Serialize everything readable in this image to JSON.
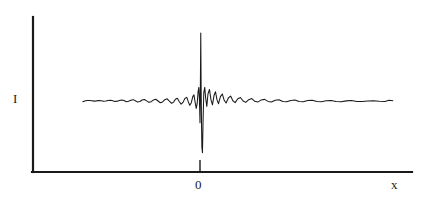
{
  "figure": {
    "background_color": "#ffffff",
    "line_color": "#1a1a1a",
    "axis_color": "#1a1a1a"
  },
  "axes": {
    "y_axis_label": "I",
    "x_axis_label": "x",
    "y_axis_name": "y-axis-line",
    "x_axis_name": "x-axis-line",
    "origin_px": {
      "x": 33,
      "y": 172
    },
    "y_axis_top_px": 17,
    "x_axis_right_px": 412,
    "ticks": [
      {
        "label": "0",
        "x_px": 200
      }
    ]
  },
  "chart_data": {
    "type": "line",
    "title": "",
    "subtitle": "",
    "xlabel": "x",
    "ylabel": "I",
    "grid": false,
    "legend": null,
    "xlim": [
      -1.0,
      1.0
    ],
    "ylim": [
      0,
      1
    ],
    "xticks": [
      0
    ],
    "xticklabels": [
      "0"
    ],
    "yticks": [],
    "yticklabels": [],
    "baseline_level": 0.46,
    "series": [
      {
        "name": "interferogram",
        "color": "#1a1a1a",
        "x_start": -0.62,
        "x_end": 1.02,
        "points": [
          [
            -0.62,
            0.455
          ],
          [
            -0.61,
            0.46
          ],
          [
            -0.598,
            0.463
          ],
          [
            -0.585,
            0.464
          ],
          [
            -0.572,
            0.462
          ],
          [
            -0.56,
            0.459
          ],
          [
            -0.548,
            0.461
          ],
          [
            -0.535,
            0.464
          ],
          [
            -0.522,
            0.462
          ],
          [
            -0.51,
            0.458
          ],
          [
            -0.498,
            0.46
          ],
          [
            -0.486,
            0.464
          ],
          [
            -0.474,
            0.466
          ],
          [
            -0.462,
            0.462
          ],
          [
            -0.45,
            0.457
          ],
          [
            -0.438,
            0.459
          ],
          [
            -0.426,
            0.464
          ],
          [
            -0.414,
            0.468
          ],
          [
            -0.402,
            0.463
          ],
          [
            -0.39,
            0.455
          ],
          [
            -0.378,
            0.458
          ],
          [
            -0.366,
            0.466
          ],
          [
            -0.354,
            0.47
          ],
          [
            -0.342,
            0.462
          ],
          [
            -0.33,
            0.452
          ],
          [
            -0.318,
            0.456
          ],
          [
            -0.306,
            0.467
          ],
          [
            -0.294,
            0.471
          ],
          [
            -0.282,
            0.461
          ],
          [
            -0.27,
            0.45
          ],
          [
            -0.258,
            0.455
          ],
          [
            -0.246,
            0.468
          ],
          [
            -0.234,
            0.473
          ],
          [
            -0.222,
            0.46
          ],
          [
            -0.21,
            0.447
          ],
          [
            -0.198,
            0.453
          ],
          [
            -0.186,
            0.47
          ],
          [
            -0.174,
            0.476
          ],
          [
            -0.162,
            0.459
          ],
          [
            -0.15,
            0.443
          ],
          [
            -0.14,
            0.452
          ],
          [
            -0.13,
            0.473
          ],
          [
            -0.12,
            0.48
          ],
          [
            -0.11,
            0.456
          ],
          [
            -0.1,
            0.437
          ],
          [
            -0.09,
            0.45
          ],
          [
            -0.08,
            0.478
          ],
          [
            -0.07,
            0.487
          ],
          [
            -0.062,
            0.455
          ],
          [
            -0.054,
            0.428
          ],
          [
            -0.046,
            0.448
          ],
          [
            -0.038,
            0.492
          ],
          [
            -0.032,
            0.505
          ],
          [
            -0.026,
            0.452
          ],
          [
            -0.02,
            0.405
          ],
          [
            -0.015,
            0.44
          ],
          [
            -0.01,
            0.53
          ],
          [
            -0.006,
            0.56
          ],
          [
            -0.003,
            0.47
          ],
          [
            0.0,
            0.3
          ],
          [
            0.002,
            0.56
          ],
          [
            0.004,
            0.96
          ],
          [
            0.006,
            0.56
          ],
          [
            0.008,
            0.3
          ],
          [
            0.01,
            0.12
          ],
          [
            0.013,
            0.08
          ],
          [
            0.016,
            0.3
          ],
          [
            0.02,
            0.52
          ],
          [
            0.025,
            0.56
          ],
          [
            0.03,
            0.48
          ],
          [
            0.036,
            0.42
          ],
          [
            0.042,
            0.51
          ],
          [
            0.05,
            0.545
          ],
          [
            0.058,
            0.47
          ],
          [
            0.066,
            0.432
          ],
          [
            0.074,
            0.5
          ],
          [
            0.082,
            0.528
          ],
          [
            0.09,
            0.468
          ],
          [
            0.098,
            0.44
          ],
          [
            0.108,
            0.492
          ],
          [
            0.118,
            0.512
          ],
          [
            0.128,
            0.465
          ],
          [
            0.138,
            0.445
          ],
          [
            0.15,
            0.482
          ],
          [
            0.162,
            0.496
          ],
          [
            0.174,
            0.462
          ],
          [
            0.186,
            0.448
          ],
          [
            0.2,
            0.476
          ],
          [
            0.214,
            0.486
          ],
          [
            0.228,
            0.46
          ],
          [
            0.242,
            0.45
          ],
          [
            0.258,
            0.47
          ],
          [
            0.274,
            0.478
          ],
          [
            0.29,
            0.458
          ],
          [
            0.306,
            0.452
          ],
          [
            0.324,
            0.468
          ],
          [
            0.342,
            0.472
          ],
          [
            0.36,
            0.457
          ],
          [
            0.378,
            0.453
          ],
          [
            0.398,
            0.465
          ],
          [
            0.418,
            0.469
          ],
          [
            0.438,
            0.456
          ],
          [
            0.458,
            0.454
          ],
          [
            0.48,
            0.464
          ],
          [
            0.502,
            0.467
          ],
          [
            0.524,
            0.456
          ],
          [
            0.546,
            0.455
          ],
          [
            0.57,
            0.463
          ],
          [
            0.594,
            0.465
          ],
          [
            0.618,
            0.456
          ],
          [
            0.642,
            0.455
          ],
          [
            0.668,
            0.462
          ],
          [
            0.694,
            0.464
          ],
          [
            0.72,
            0.457
          ],
          [
            0.746,
            0.455
          ],
          [
            0.774,
            0.461
          ],
          [
            0.802,
            0.463
          ],
          [
            0.83,
            0.457
          ],
          [
            0.858,
            0.456
          ],
          [
            0.888,
            0.46
          ],
          [
            0.918,
            0.462
          ],
          [
            0.948,
            0.458
          ],
          [
            0.978,
            0.457
          ],
          [
            1.0,
            0.466
          ],
          [
            1.02,
            0.462
          ]
        ]
      }
    ]
  }
}
